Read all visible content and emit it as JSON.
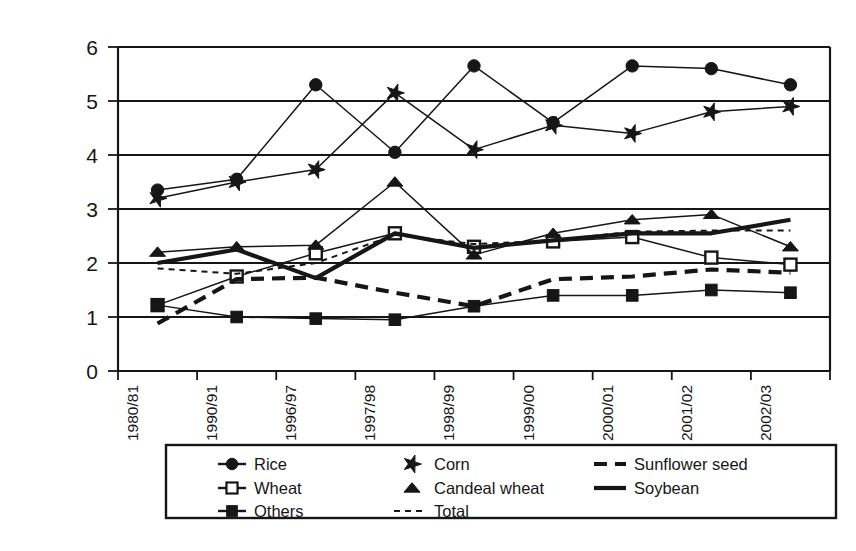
{
  "chart_data": {
    "type": "line",
    "title": "",
    "xlabel": "",
    "ylabel": "Yield (tn/ha)",
    "ylim": [
      0,
      6
    ],
    "ytick_values": [
      0,
      1,
      2,
      3,
      4,
      5,
      6
    ],
    "ytick_labels": [
      "0",
      "1",
      "2",
      "3",
      "4",
      "5",
      "6"
    ],
    "grid": true,
    "grid_axis": "y",
    "legend_position": "bottom",
    "categories": [
      "1980/81",
      "1990/91",
      "1996/97",
      "1997/98",
      "1998/99",
      "1999/00",
      "2000/01",
      "2001/02",
      "2002/03"
    ],
    "series": [
      {
        "name": "Rice",
        "marker": "filled-circle",
        "line": "solid-thin",
        "values": [
          3.35,
          3.55,
          5.3,
          4.05,
          5.65,
          4.6,
          5.65,
          5.6,
          5.3
        ]
      },
      {
        "name": "Wheat",
        "marker": "open-square",
        "line": "solid-thin",
        "values": [
          1.22,
          1.75,
          2.18,
          2.55,
          2.3,
          2.4,
          2.48,
          2.1,
          1.97
        ]
      },
      {
        "name": "Others",
        "marker": "filled-square",
        "line": "solid-thin",
        "values": [
          1.22,
          1.0,
          0.97,
          0.95,
          1.2,
          1.4,
          1.4,
          1.5,
          1.45
        ]
      },
      {
        "name": "Corn",
        "marker": "star",
        "line": "solid-thin",
        "values": [
          3.2,
          3.5,
          3.73,
          5.15,
          4.1,
          4.55,
          4.4,
          4.8,
          4.9
        ]
      },
      {
        "name": "Candeal wheat",
        "marker": "filled-triangle",
        "line": "solid-thin",
        "values": [
          2.2,
          2.3,
          2.33,
          3.5,
          2.15,
          2.55,
          2.8,
          2.9,
          2.3
        ]
      },
      {
        "name": "Total",
        "marker": "none",
        "line": "dotted",
        "values": [
          1.9,
          1.8,
          2.0,
          2.52,
          2.35,
          2.42,
          2.58,
          2.6,
          2.6
        ]
      },
      {
        "name": "Sunflower seed",
        "marker": "none",
        "line": "dashed",
        "values": [
          0.88,
          1.7,
          1.73,
          1.45,
          1.2,
          1.7,
          1.75,
          1.88,
          1.82
        ]
      },
      {
        "name": "Soybean",
        "marker": "none",
        "line": "solid-thick",
        "values": [
          2.0,
          2.25,
          1.72,
          2.55,
          2.28,
          2.42,
          2.55,
          2.55,
          2.8
        ]
      }
    ]
  },
  "axes": {
    "y_title": "Yield (tn/ha)",
    "y_ticks": [
      "6",
      "5",
      "4",
      "3",
      "2",
      "1",
      "0"
    ],
    "x_ticks": [
      "1980/81",
      "1990/91",
      "1996/97",
      "1997/98",
      "1998/99",
      "1999/00",
      "2000/01",
      "2001/02",
      "2002/03"
    ]
  },
  "legend": {
    "columns": [
      [
        {
          "label": "Rice",
          "symbol": "filled-circle"
        },
        {
          "label": "Wheat",
          "symbol": "open-square"
        },
        {
          "label": "Others",
          "symbol": "filled-square"
        }
      ],
      [
        {
          "label": "Corn",
          "symbol": "star"
        },
        {
          "label": "Candeal wheat",
          "symbol": "filled-triangle"
        },
        {
          "label": "Total",
          "symbol": "dotted-line"
        }
      ],
      [
        {
          "label": "Sunflower seed",
          "symbol": "dashed-line"
        },
        {
          "label": "Soybean",
          "symbol": "solid-line"
        }
      ]
    ]
  },
  "style": {
    "ink": "#161616",
    "background": "#ffffff"
  }
}
